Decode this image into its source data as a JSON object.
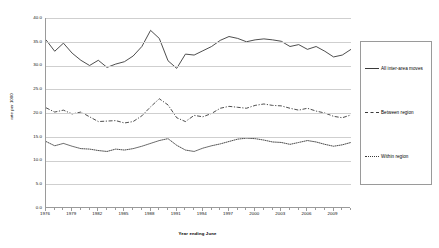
{
  "chart_data": {
    "type": "line",
    "title": "",
    "xlabel": "Year ending June",
    "ylabel": "rate per 1000",
    "ylim": [
      0,
      40
    ],
    "ytick_labels": [
      "40.0",
      "35.0",
      "30.0",
      "25.0",
      "20.0",
      "15.0",
      "10.0",
      "5.0",
      "0.0"
    ],
    "ytick_values": [
      40,
      35,
      30,
      25,
      20,
      15,
      10,
      5,
      0
    ],
    "xlim": [
      1976,
      2011
    ],
    "xtick_labels": [
      "1976",
      "1979",
      "1982",
      "1985",
      "1988",
      "1991",
      "1994",
      "1997",
      "2000",
      "2003",
      "2006",
      "2009"
    ],
    "xtick_values": [
      1976,
      1979,
      1982,
      1985,
      1988,
      1991,
      1994,
      1997,
      2000,
      2003,
      2006,
      2009
    ],
    "grid": true,
    "legend_position": "right",
    "x": [
      1976,
      1977,
      1978,
      1979,
      1980,
      1981,
      1982,
      1983,
      1984,
      1985,
      1986,
      1987,
      1988,
      1989,
      1990,
      1991,
      1992,
      1993,
      1994,
      1995,
      1996,
      1997,
      1998,
      1999,
      2000,
      2001,
      2002,
      2003,
      2004,
      2005,
      2006,
      2007,
      2008,
      2009,
      2010,
      2011
    ],
    "series": [
      {
        "name": "All inter-area moves",
        "style": "solid",
        "color": "#3a3a3a",
        "values": [
          35.4,
          33.0,
          34.7,
          32.6,
          31.1,
          30.0,
          31.1,
          29.6,
          30.3,
          30.8,
          32.0,
          34.0,
          37.4,
          35.7,
          31.0,
          29.4,
          32.4,
          32.2,
          33.1,
          34.0,
          35.3,
          36.1,
          35.7,
          35.0,
          35.4,
          35.6,
          35.4,
          35.1,
          34.0,
          34.4,
          33.4,
          34.0,
          33.0,
          31.8,
          32.2,
          33.4
        ]
      },
      {
        "name": "Between region",
        "style": "dashed",
        "color": "#3a3a3a",
        "values": [
          21.1,
          20.2,
          20.6,
          19.8,
          20.2,
          19.2,
          18.2,
          18.3,
          18.4,
          17.9,
          18.2,
          19.4,
          21.3,
          23.0,
          21.7,
          19.0,
          18.2,
          19.5,
          19.2,
          19.9,
          21.0,
          21.4,
          21.2,
          21.0,
          21.6,
          21.9,
          21.6,
          21.5,
          21.0,
          20.6,
          21.0,
          20.4,
          20.0,
          19.3,
          19.0,
          19.6
        ]
      },
      {
        "name": "Within region",
        "style": "dotted",
        "color": "#3a3a3a",
        "values": [
          14.0,
          13.1,
          13.6,
          13.0,
          12.5,
          12.4,
          12.1,
          11.9,
          12.4,
          12.2,
          12.5,
          13.0,
          13.6,
          14.2,
          14.6,
          13.2,
          12.2,
          11.9,
          12.6,
          13.1,
          13.5,
          14.0,
          14.5,
          14.7,
          14.6,
          14.3,
          13.9,
          13.8,
          13.4,
          13.8,
          14.2,
          13.9,
          13.4,
          13.0,
          13.3,
          13.8
        ]
      }
    ]
  },
  "legend": {
    "entries": [
      {
        "label": "All inter-area moves"
      },
      {
        "label": "Between region"
      },
      {
        "label": "Within region"
      }
    ]
  }
}
